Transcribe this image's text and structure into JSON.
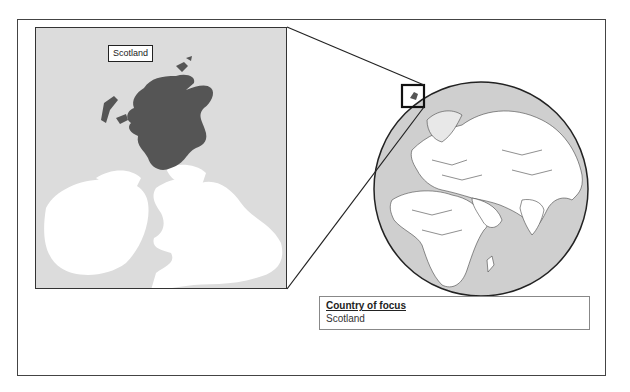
{
  "inset_map": {
    "label": "Scotland",
    "region_highlight_color": "#555555",
    "land_color": "#ffffff",
    "sea_color": "#dcdcdc"
  },
  "globe": {
    "focus_box_label": "Scotland location",
    "ocean_color": "#cfcfcf",
    "land_color": "#ffffff",
    "border_color": "#333333"
  },
  "legend": {
    "title": "Country of focus",
    "value": "Scotland"
  }
}
